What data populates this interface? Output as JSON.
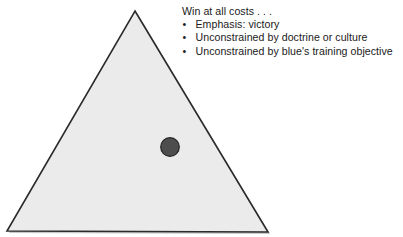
{
  "slide": {
    "width": 403,
    "height": 237,
    "background_color": "#ffffff"
  },
  "figure": {
    "shape_name": "triangle",
    "fill_color": "#ebebeb",
    "stroke_color": "#2b2b2b",
    "shadow_color": "#9a9a9a",
    "apex": {
      "x": 135,
      "y": 11
    },
    "bottom_left": {
      "x": 7,
      "y": 231
    },
    "bottom_right": {
      "x": 268,
      "y": 232
    },
    "marker": {
      "shape_name": "circle",
      "center_x": 170,
      "center_y": 147,
      "radius": 9.5,
      "fill_color": "#4d4d4d",
      "stroke_color": "#262626"
    }
  },
  "callout": {
    "headline": "Win at all costs . . .",
    "bullet_glyph": "•",
    "bullets": [
      "Emphasis: victory",
      "Unconstrained by doctrine or culture",
      "Unconstrained by blue's training objective"
    ],
    "text_color": "#1a1a1a"
  }
}
